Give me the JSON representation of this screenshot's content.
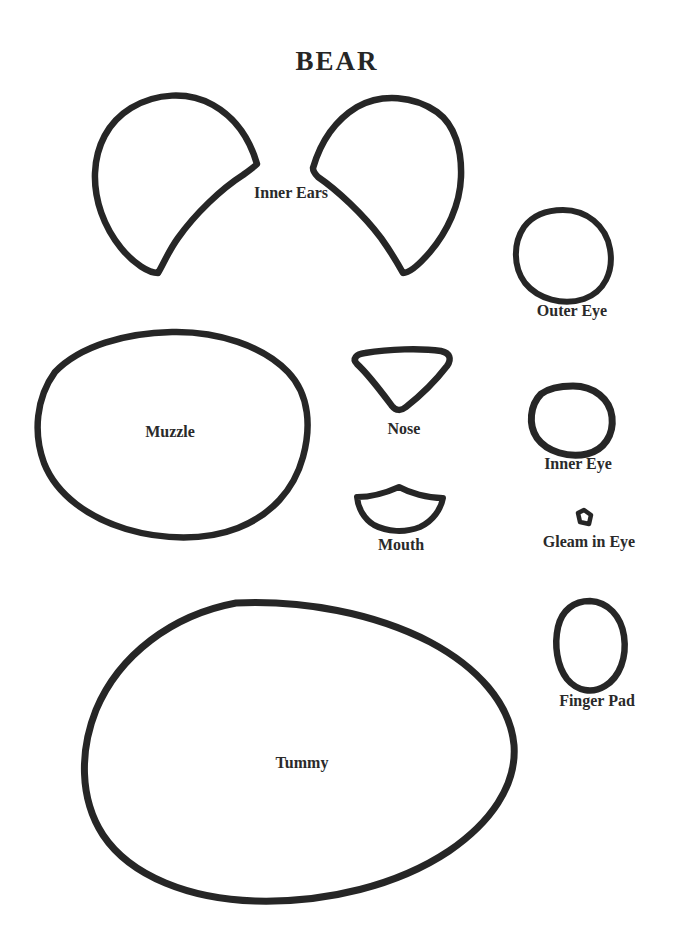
{
  "document": {
    "title": "BEAR",
    "background_color": "#ffffff",
    "ink_color": "#262626",
    "label_color": "#2a2a2a",
    "kind": "sewing pattern piece sheet"
  },
  "pieces": [
    {
      "id": "inner-ears",
      "label": "Inner Ears",
      "count": 2,
      "shape": "mirrored teardrop wedge",
      "label_x": 291,
      "label_y": 193
    },
    {
      "id": "outer-eye",
      "label": "Outer Eye",
      "count": 1,
      "shape": "oval",
      "label_x": 572,
      "label_y": 311
    },
    {
      "id": "muzzle",
      "label": "Muzzle",
      "count": 1,
      "shape": "large rounded oval",
      "label_x": 170,
      "label_y": 424
    },
    {
      "id": "nose",
      "label": "Nose",
      "count": 1,
      "shape": "rounded downward triangle",
      "label_x": 404,
      "label_y": 422
    },
    {
      "id": "inner-eye",
      "label": "Inner Eye",
      "count": 1,
      "shape": "circle",
      "label_x": 578,
      "label_y": 457
    },
    {
      "id": "mouth",
      "label": "Mouth",
      "count": 1,
      "shape": "curved fan",
      "label_x": 401,
      "label_y": 538
    },
    {
      "id": "gleam-in-eye",
      "label": "Gleam in Eye",
      "count": 1,
      "shape": "tiny rotated square",
      "label_x": 589,
      "label_y": 536
    },
    {
      "id": "finger-pad",
      "label": "Finger Pad",
      "count": 1,
      "shape": "egg",
      "label_x": 597,
      "label_y": 695
    },
    {
      "id": "tummy",
      "label": "Tummy",
      "count": 1,
      "shape": "large egg pointing right",
      "label_x": 302,
      "label_y": 756
    }
  ]
}
